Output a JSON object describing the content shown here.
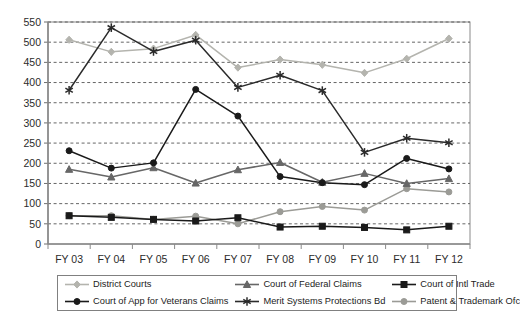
{
  "chart_data": {
    "type": "line",
    "title": "",
    "xlabel": "",
    "ylabel": "",
    "ylim": [
      0,
      550
    ],
    "ytick_step": 50,
    "grid": true,
    "grid_style": "dashed-horizontal",
    "legend_position": "bottom",
    "categories": [
      "FY 03",
      "FY 04",
      "FY 05",
      "FY 06",
      "FY 07",
      "FY 08",
      "FY 09",
      "FY 10",
      "FY 11",
      "FY 12"
    ],
    "ytick_labels": [
      "0",
      "50",
      "100",
      "150",
      "200",
      "250",
      "300",
      "350",
      "400",
      "450",
      "500",
      "550"
    ],
    "series": [
      {
        "name": "District Courts",
        "color": "#b4b4ae",
        "marker": "diamond",
        "values": [
          506,
          476,
          484,
          518,
          437,
          457,
          444,
          424,
          459,
          509
        ]
      },
      {
        "name": "Court of Federal Claims",
        "color": "#676767",
        "marker": "triangle",
        "values": [
          185,
          166,
          189,
          151,
          184,
          202,
          153,
          175,
          150,
          162
        ]
      },
      {
        "name": "Court of Intl Trade",
        "color": "#1a1a1a",
        "marker": "square",
        "values": [
          70,
          66,
          61,
          57,
          65,
          42,
          44,
          41,
          35,
          44
        ]
      },
      {
        "name": "Court of App for Veterans Claims",
        "color": "#1a1a1a",
        "marker": "circle",
        "values": [
          231,
          188,
          201,
          383,
          317,
          167,
          152,
          147,
          212,
          186
        ]
      },
      {
        "name": "Merit Systems Protections Bd",
        "color": "#2b2b2b",
        "marker": "asterisk",
        "values": [
          381,
          536,
          477,
          505,
          388,
          418,
          380,
          227,
          262,
          251
        ]
      },
      {
        "name": "Patent & Trademark Ofc",
        "color": "#9b9b96",
        "marker": "circle",
        "values": [
          70,
          70,
          61,
          69,
          50,
          80,
          93,
          84,
          137,
          129
        ]
      }
    ]
  },
  "legend": {
    "entries": [
      {
        "label": "District Courts"
      },
      {
        "label": "Court of Federal Claims"
      },
      {
        "label": "Court of Intl Trade"
      },
      {
        "label": "Court of App for Veterans Claims"
      },
      {
        "label": "Merit Systems Protections Bd"
      },
      {
        "label": "Patent & Trademark Ofc"
      }
    ]
  }
}
